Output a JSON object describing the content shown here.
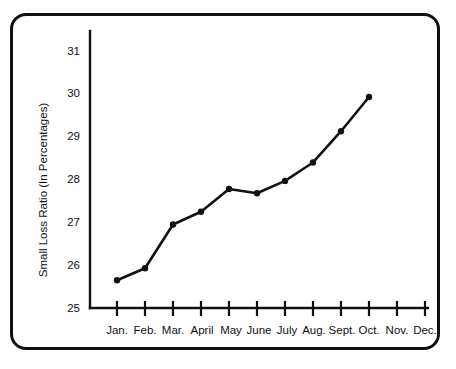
{
  "chart_data": {
    "type": "line",
    "title": "",
    "xlabel": "",
    "ylabel": "Small Loss Ratio  (In Percentages)",
    "categories": [
      "Jan.",
      "Feb.",
      "Mar.",
      "April",
      "May",
      "June",
      "July",
      "Aug.",
      "Sept.",
      "Oct.",
      "Nov.",
      "Dec."
    ],
    "values": [
      25.65,
      25.93,
      26.95,
      27.25,
      27.78,
      27.68,
      27.97,
      28.4,
      29.13,
      29.93,
      null,
      null
    ],
    "ylim": [
      25,
      31.4
    ],
    "yticks": [
      25,
      26,
      27,
      28,
      29,
      30,
      31
    ],
    "ytick_labels": [
      "25",
      "26",
      "27",
      "28",
      "29",
      "30",
      "31"
    ],
    "grid": false,
    "legend": "none",
    "series": [
      {
        "name": "Small Loss Ratio",
        "values": [
          25.65,
          25.93,
          26.95,
          27.25,
          27.78,
          27.68,
          27.97,
          28.4,
          29.13,
          29.93,
          null,
          null
        ],
        "color": "#111111",
        "marker": "circle"
      }
    ]
  },
  "frame": {
    "border_color": "#111111",
    "background": "#ffffff"
  }
}
